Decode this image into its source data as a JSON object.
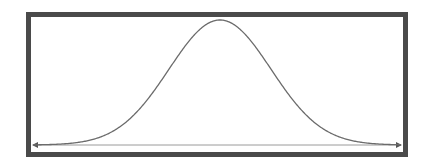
{
  "diagram": {
    "type": "normal-distribution-curve",
    "frame_color": "#4a4a4a",
    "curve_color": "#6b6b6b",
    "axis_color": "#8a8a8a",
    "curve": {
      "mean_x": 220,
      "sigma_px": 51,
      "peak_y": 20,
      "baseline_y": 145,
      "x_start": 34,
      "x_end": 401
    },
    "axis": {
      "y": 145,
      "x_start": 33,
      "x_end": 401,
      "arrow_left": "left-arrow",
      "arrow_right": "right-arrow"
    }
  }
}
